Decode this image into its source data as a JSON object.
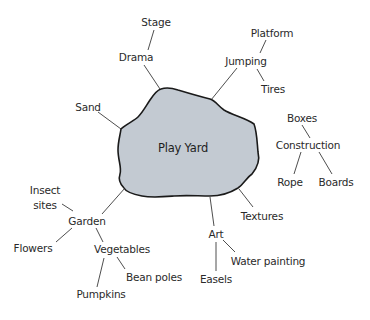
{
  "diagram": {
    "type": "concept-web",
    "colors": {
      "blob_fill": "#c3cad2",
      "blob_stroke": "#1a1a1a",
      "line": "#3a3a3a",
      "text": "#2a2a2a"
    },
    "center": {
      "label": "Play Yard",
      "x": 183,
      "y": 148
    },
    "nodes": {
      "stage": {
        "label": "Stage",
        "x": 156,
        "y": 22
      },
      "drama": {
        "label": "Drama",
        "x": 136,
        "y": 57
      },
      "sand": {
        "label": "Sand",
        "x": 88,
        "y": 107
      },
      "platform": {
        "label": "Platform",
        "x": 272,
        "y": 33
      },
      "jumping": {
        "label": "Jumping",
        "x": 246,
        "y": 61
      },
      "tires": {
        "label": "Tires",
        "x": 273,
        "y": 89
      },
      "boxes": {
        "label": "Boxes",
        "x": 302,
        "y": 118
      },
      "construction": {
        "label": "Construction",
        "x": 308,
        "y": 145
      },
      "rope": {
        "label": "Rope",
        "x": 290,
        "y": 182
      },
      "boards": {
        "label": "Boards",
        "x": 336,
        "y": 182
      },
      "insect_sites": {
        "label": "Insect\nsites",
        "line1": "Insect",
        "line2": "sites",
        "x": 45,
        "y": 197
      },
      "garden": {
        "label": "Garden",
        "x": 87,
        "y": 221
      },
      "flowers": {
        "label": "Flowers",
        "x": 33,
        "y": 248
      },
      "vegetables": {
        "label": "Vegetables",
        "x": 122,
        "y": 249
      },
      "bean_poles": {
        "label": "Bean poles",
        "x": 154,
        "y": 277
      },
      "pumpkins": {
        "label": "Pumpkins",
        "x": 101,
        "y": 294
      },
      "textures": {
        "label": "Textures",
        "x": 262,
        "y": 216
      },
      "art": {
        "label": "Art",
        "x": 216,
        "y": 234
      },
      "water_painting": {
        "label": "Water painting",
        "x": 268,
        "y": 261
      },
      "easels": {
        "label": "Easels",
        "x": 216,
        "y": 279
      }
    },
    "edges": [
      [
        "Play Yard",
        "Drama"
      ],
      [
        "Drama",
        "Stage"
      ],
      [
        "Play Yard",
        "Sand"
      ],
      [
        "Play Yard",
        "Jumping"
      ],
      [
        "Jumping",
        "Platform"
      ],
      [
        "Jumping",
        "Tires"
      ],
      [
        "Boxes",
        "Construction"
      ],
      [
        "Construction",
        "Rope"
      ],
      [
        "Construction",
        "Boards"
      ],
      [
        "Play Yard",
        "Garden"
      ],
      [
        "Garden",
        "Insect sites"
      ],
      [
        "Garden",
        "Flowers"
      ],
      [
        "Garden",
        "Vegetables"
      ],
      [
        "Vegetables",
        "Bean poles"
      ],
      [
        "Vegetables",
        "Pumpkins"
      ],
      [
        "Play Yard",
        "Textures"
      ],
      [
        "Play Yard",
        "Art"
      ],
      [
        "Art",
        "Water painting"
      ],
      [
        "Art",
        "Easels"
      ]
    ]
  }
}
